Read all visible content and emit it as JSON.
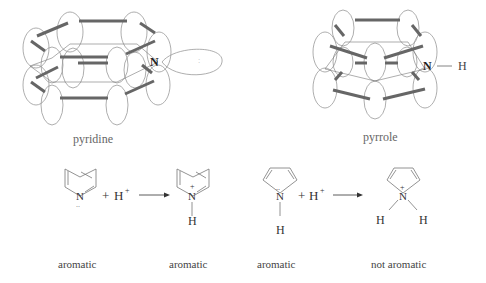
{
  "diagram": {
    "top": {
      "pyridine": {
        "label": "pyridine",
        "n_atom": "N",
        "lone_pair": ":"
      },
      "pyrrole": {
        "label": "pyrrole",
        "n_atom": "N",
        "h_atom": "H"
      }
    },
    "reactions": {
      "pyridine_protonation": {
        "reactant_n": "N",
        "reactant_lone_pair": "..",
        "plus": "+",
        "proton": "H",
        "proton_charge": "+",
        "product_n": "N",
        "product_charge": "+",
        "product_h": "H",
        "reactant_caption": "aromatic",
        "product_caption": "aromatic"
      },
      "pyrrole_protonation": {
        "reactant_n": "N",
        "reactant_lone_pair": "..",
        "reactant_h": "H",
        "plus": "+",
        "proton": "H",
        "proton_charge": "+",
        "product_n": "N",
        "product_charge": "+",
        "product_h_left": "H",
        "product_h_right": "H",
        "reactant_caption": "aromatic",
        "product_caption": "not aromatic"
      }
    },
    "colors": {
      "bond": "#666666",
      "orbital": "#999999",
      "text": "#333333"
    }
  }
}
